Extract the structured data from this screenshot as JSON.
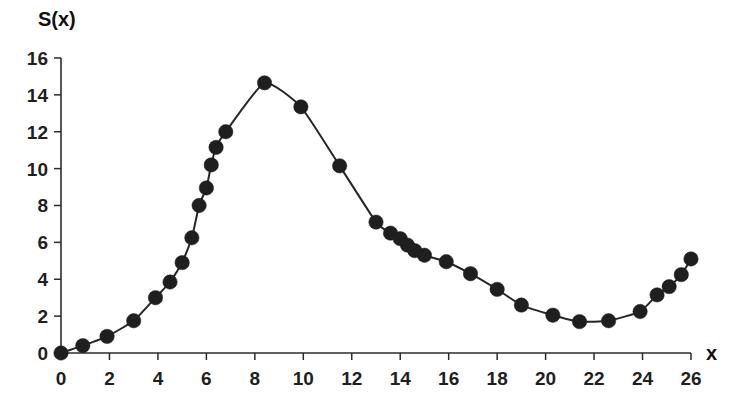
{
  "chart_data": {
    "type": "scatter",
    "title": "",
    "subtitle": "",
    "xlabel": "x",
    "ylabel": "S(x)",
    "xlim": [
      0,
      26
    ],
    "ylim": [
      0,
      16
    ],
    "grid": false,
    "legend": null,
    "legend_position": "none",
    "marker": "filled-circle",
    "marker_color": "#1f1f1f",
    "line_color": "#262626",
    "background_color": "#ffffff",
    "xticks": [
      0,
      2,
      4,
      6,
      8,
      10,
      12,
      14,
      16,
      18,
      20,
      22,
      24,
      26
    ],
    "xtick_labels": [
      "0",
      "2",
      "4",
      "6",
      "8",
      "10",
      "12",
      "14",
      "16",
      "18",
      "20",
      "22",
      "24",
      "26"
    ],
    "yticks": [
      0,
      2,
      4,
      6,
      8,
      10,
      12,
      14,
      16
    ],
    "ytick_labels": [
      "0",
      "2",
      "4",
      "6",
      "8",
      "10",
      "12",
      "14",
      "16"
    ],
    "x": [
      0.0,
      0.9,
      1.9,
      3.0,
      3.9,
      4.5,
      5.0,
      5.4,
      5.7,
      6.0,
      6.2,
      6.4,
      6.8,
      8.4,
      9.9,
      11.5,
      13.0,
      13.6,
      14.0,
      14.3,
      14.6,
      15.0,
      15.9,
      16.9,
      18.0,
      19.0,
      20.3,
      21.4,
      22.6,
      23.9,
      24.6,
      25.1,
      25.6,
      26.0
    ],
    "y": [
      0.0,
      0.4,
      0.9,
      1.75,
      3.0,
      3.85,
      4.9,
      6.25,
      8.0,
      8.95,
      10.2,
      11.15,
      12.0,
      14.65,
      13.35,
      10.15,
      7.1,
      6.5,
      6.2,
      5.85,
      5.55,
      5.3,
      4.95,
      4.3,
      3.45,
      2.6,
      2.05,
      1.7,
      1.75,
      2.25,
      3.15,
      3.6,
      4.25,
      5.1
    ],
    "points": [
      {
        "x": 0.0,
        "y": 0.0
      },
      {
        "x": 0.9,
        "y": 0.4
      },
      {
        "x": 1.9,
        "y": 0.9
      },
      {
        "x": 3.0,
        "y": 1.75
      },
      {
        "x": 3.9,
        "y": 3.0
      },
      {
        "x": 4.5,
        "y": 3.85
      },
      {
        "x": 5.0,
        "y": 4.9
      },
      {
        "x": 5.4,
        "y": 6.25
      },
      {
        "x": 5.7,
        "y": 8.0
      },
      {
        "x": 6.0,
        "y": 8.95
      },
      {
        "x": 6.2,
        "y": 10.2
      },
      {
        "x": 6.4,
        "y": 11.15
      },
      {
        "x": 6.8,
        "y": 12.0
      },
      {
        "x": 8.4,
        "y": 14.65
      },
      {
        "x": 9.9,
        "y": 13.35
      },
      {
        "x": 11.5,
        "y": 10.15
      },
      {
        "x": 13.0,
        "y": 7.1
      },
      {
        "x": 13.6,
        "y": 6.5
      },
      {
        "x": 14.0,
        "y": 6.2
      },
      {
        "x": 14.3,
        "y": 5.85
      },
      {
        "x": 14.6,
        "y": 5.55
      },
      {
        "x": 15.0,
        "y": 5.3
      },
      {
        "x": 15.9,
        "y": 4.95
      },
      {
        "x": 16.9,
        "y": 4.3
      },
      {
        "x": 18.0,
        "y": 3.45
      },
      {
        "x": 19.0,
        "y": 2.6
      },
      {
        "x": 20.3,
        "y": 2.05
      },
      {
        "x": 21.4,
        "y": 1.7
      },
      {
        "x": 22.6,
        "y": 1.75
      },
      {
        "x": 23.9,
        "y": 2.25
      },
      {
        "x": 24.6,
        "y": 3.15
      },
      {
        "x": 25.1,
        "y": 3.6
      },
      {
        "x": 25.6,
        "y": 4.25
      },
      {
        "x": 26.0,
        "y": 5.1
      }
    ]
  },
  "geometry": {
    "origin_px": [
      61,
      353
    ],
    "x_scale_px_per_unit": 24.23,
    "y_scale_px_per_unit": 18.44,
    "marker_radius_px": 7.2,
    "tick_len_px": 7
  },
  "labels": {
    "y_axis_title": "S(x)",
    "x_axis_title": "x"
  }
}
